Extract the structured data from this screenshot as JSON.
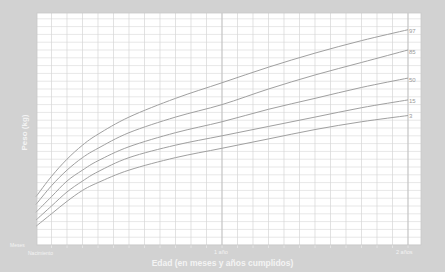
{
  "chart_data": {
    "type": "line",
    "title": "",
    "xlabel": "Edad (en meses y años cumplidos)",
    "ylabel": "Peso (kg)",
    "x_unit": "months",
    "x": [
      0,
      1,
      2,
      3,
      4,
      6,
      9,
      12,
      15,
      18,
      21,
      24
    ],
    "xlim": [
      0,
      24
    ],
    "ylim": [
      1.5,
      16.3
    ],
    "x_tick_labels": {
      "start_top": "Meses",
      "start": "Nacimiento",
      "12": "1 año",
      "24": "2 años"
    },
    "grid": true,
    "legend_position": "right-end-labels",
    "series": [
      {
        "name": "97",
        "values": [
          4.6,
          5.9,
          7.0,
          7.9,
          8.6,
          9.7,
          10.9,
          11.9,
          12.9,
          13.8,
          14.6,
          15.3
        ]
      },
      {
        "name": "85",
        "values": [
          4.1,
          5.3,
          6.3,
          7.1,
          7.7,
          8.7,
          9.7,
          10.5,
          11.5,
          12.4,
          13.2,
          14.0
        ]
      },
      {
        "name": "50",
        "values": [
          3.6,
          4.6,
          5.6,
          6.3,
          6.9,
          7.8,
          8.7,
          9.4,
          10.2,
          10.9,
          11.6,
          12.2
        ]
      },
      {
        "name": "15",
        "values": [
          3.1,
          4.0,
          4.9,
          5.6,
          6.2,
          7.1,
          7.9,
          8.5,
          9.1,
          9.7,
          10.3,
          10.8
        ]
      },
      {
        "name": "3",
        "values": [
          2.7,
          3.5,
          4.3,
          5.0,
          5.5,
          6.3,
          7.1,
          7.7,
          8.3,
          8.9,
          9.4,
          9.8
        ]
      }
    ]
  },
  "labels": {
    "ylabel": "Peso (kg)",
    "xlabel": "Edad (en meses y años cumplidos)",
    "meses": "Meses",
    "nacimiento": "Nacimiento",
    "one_year": "1 año",
    "two_years": "2 años",
    "pct": [
      "97",
      "85",
      "50",
      "15",
      "3"
    ]
  },
  "colors": {
    "frame": "#d2d2d2",
    "plot_bg": "#ffffff",
    "grid": "#d6d6d6",
    "grid_major": "#c4c4c4",
    "curve": "#a0a0a0"
  }
}
